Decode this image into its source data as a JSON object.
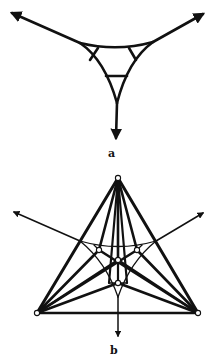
{
  "figure": {
    "stroke_color": "#111111",
    "background": "#ffffff",
    "labels": {
      "a": "a",
      "b": "b"
    }
  },
  "panel_a": {
    "label": "a",
    "label_pos": [
      108,
      157
    ],
    "arrows": [
      {
        "name": "arrow-left",
        "from": [
          80,
          43
        ],
        "to": [
          12,
          13
        ]
      },
      {
        "name": "arrow-right",
        "from": [
          153,
          42
        ],
        "to": [
          203,
          14
        ]
      },
      {
        "name": "arrow-down",
        "from": [
          117,
          103
        ],
        "to": [
          116,
          138
        ]
      }
    ],
    "curves": [
      {
        "name": "top-arc",
        "d": "M80,43 Q117,52 153,42"
      },
      {
        "name": "left-arc",
        "d": "M80,43 Q105,60 117,103"
      },
      {
        "name": "right-arc",
        "d": "M153,42 Q128,60 117,103"
      }
    ],
    "struts": [
      {
        "name": "strut-left",
        "from": [
          98,
          48
        ],
        "to": [
          90,
          60
        ]
      },
      {
        "name": "strut-right",
        "from": [
          129,
          48
        ],
        "to": [
          136,
          60
        ]
      },
      {
        "name": "strut-bottom",
        "from": [
          106,
          76
        ],
        "to": [
          127,
          76
        ]
      }
    ]
  },
  "panel_b": {
    "label": "b",
    "label_pos": [
      110,
      354
    ],
    "outer_vertices": {
      "top": [
        118,
        178
      ],
      "left": [
        37,
        313
      ],
      "right": [
        198,
        313
      ]
    },
    "inner_nodes": [
      {
        "name": "inner-left",
        "pos": [
          99,
          250
        ]
      },
      {
        "name": "inner-right",
        "pos": [
          137,
          250
        ]
      },
      {
        "name": "inner-center",
        "pos": [
          118,
          260
        ]
      },
      {
        "name": "inner-lower",
        "pos": [
          118,
          283
        ]
      }
    ],
    "arrows": [
      {
        "name": "arrow-left",
        "from": [
          80,
          241
        ],
        "to": [
          14,
          212
        ]
      },
      {
        "name": "arrow-right",
        "from": [
          156,
          241
        ],
        "to": [
          203,
          213
        ]
      },
      {
        "name": "arrow-down",
        "from": [
          118,
          297
        ],
        "to": [
          118,
          336
        ]
      }
    ],
    "thin_curves": [
      {
        "name": "top-arc",
        "d": "M80,241 Q118,252 156,241"
      },
      {
        "name": "left-arc",
        "d": "M80,241 Q106,262 118,297"
      },
      {
        "name": "right-arc",
        "d": "M156,241 Q130,262 118,297"
      }
    ],
    "thin_struts": [
      {
        "name": "strut-left",
        "from": [
          94,
          245
        ],
        "to": [
          99,
          250
        ]
      },
      {
        "name": "strut-right",
        "from": [
          142,
          245
        ],
        "to": [
          137,
          250
        ]
      },
      {
        "name": "strut-bottom",
        "from": [
          109,
          283
        ],
        "to": [
          127,
          283
        ]
      }
    ]
  }
}
